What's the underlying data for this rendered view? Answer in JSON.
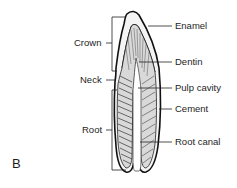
{
  "figure": {
    "panel_label": "B",
    "left_labels": {
      "crown": "Crown",
      "neck": "Neck",
      "root": "Root"
    },
    "right_labels": {
      "enamel": "Enamel",
      "dentin": "Dentin",
      "pulp_cavity": "Pulp cavity",
      "cement": "Cement",
      "root_canal": "Root canal"
    },
    "colors": {
      "outline": "#111111",
      "fill_light": "#e6e6e6",
      "fill_mid": "#cfcfcf",
      "background": "#ffffff",
      "text": "#1e1e1e"
    }
  }
}
